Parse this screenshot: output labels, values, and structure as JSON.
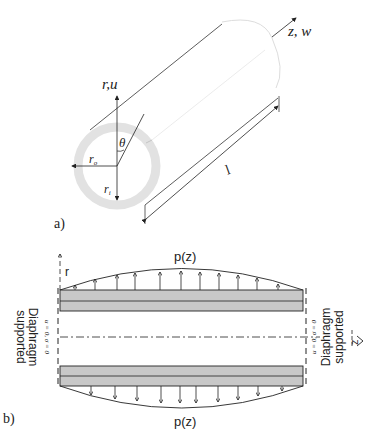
{
  "figure_a": {
    "panel_label": "a)",
    "axis_radial_label": "r,u",
    "axis_axial_label": "z, w",
    "angle_label": "θ",
    "outer_radius_label": "r",
    "outer_radius_subscript": "o",
    "inner_radius_label": "r",
    "inner_radius_subscript": "i",
    "length_label": "l"
  },
  "figure_b": {
    "panel_label": "b)",
    "top_load_label": "p(z)",
    "bottom_load_label": "p(z)",
    "radial_axis_label": "r",
    "axial_axis_label": "z",
    "left_support_label_line1": "Diaphragm",
    "left_support_label_line2": "supported",
    "left_boundary_condition": "u = 0, σ = 0",
    "right_support_label_line1": "Diaphragm",
    "right_support_label_line2": "supported",
    "right_boundary_condition": "u = 0, σ = 0"
  },
  "colors": {
    "line": "#222222",
    "wall_fill": "#c8c8c8",
    "ring_fill": "#e2e2e2"
  }
}
